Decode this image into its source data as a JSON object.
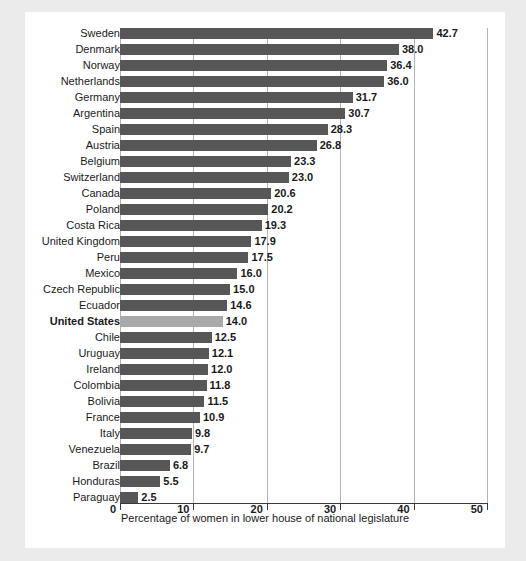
{
  "chart_data": {
    "type": "bar",
    "orientation": "horizontal",
    "title": "",
    "subtitle": "",
    "xlabel": "Percentage of women in lower house of national legislature",
    "ylabel": "",
    "xlim": [
      0,
      50
    ],
    "xticks": [
      0,
      10,
      20,
      30,
      40,
      50
    ],
    "xtick_labels": [
      "0",
      "10",
      "20",
      "30",
      "40",
      "50"
    ],
    "grid": true,
    "grid_axis": "x",
    "legend": false,
    "legend_position": "none",
    "highlight_category": "United States",
    "colors": {
      "bar": "#575757",
      "bar_highlight": "#a9a9a9",
      "gridline": "#b4b4b4",
      "axis": "#3a3a3a",
      "text": "#1a1a1a",
      "panel_background": "#ffffff",
      "page_background": "#ebebec"
    },
    "categories": [
      "Sweden",
      "Denmark",
      "Norway",
      "Netherlands",
      "Germany",
      "Argentina",
      "Spain",
      "Austria",
      "Belgium",
      "Switzerland",
      "Canada",
      "Poland",
      "Costa Rica",
      "United Kingdom",
      "Peru",
      "Mexico",
      "Czech Republic",
      "Ecuador",
      "United States",
      "Chile",
      "Uruguay",
      "Ireland",
      "Colombia",
      "Bolivia",
      "France",
      "Italy",
      "Venezuela",
      "Brazil",
      "Honduras",
      "Paraguay"
    ],
    "values": [
      42.7,
      38.0,
      36.4,
      36.0,
      31.7,
      30.7,
      28.3,
      26.8,
      23.3,
      23.0,
      20.6,
      20.2,
      19.3,
      17.9,
      17.5,
      16.0,
      15.0,
      14.6,
      14.0,
      12.5,
      12.1,
      12.0,
      11.8,
      11.5,
      10.9,
      9.8,
      9.7,
      6.8,
      5.5,
      2.5
    ],
    "value_labels": [
      "42.7",
      "38.0",
      "36.4",
      "36.0",
      "31.7",
      "30.7",
      "28.3",
      "26.8",
      "23.3",
      "23.0",
      "20.6",
      "20.2",
      "19.3",
      "17.9",
      "17.5",
      "16.0",
      "15.0",
      "14.6",
      "14.0",
      "12.5",
      "12.1",
      "12.0",
      "11.8",
      "11.5",
      "10.9",
      "9.8",
      "9.7",
      "6.8",
      "5.5",
      "2.5"
    ]
  }
}
